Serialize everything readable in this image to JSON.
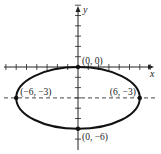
{
  "diagram": {
    "type": "ellipse-graph",
    "axes": {
      "x_label": "x",
      "y_label": "y",
      "x_range": [
        -7,
        7
      ],
      "y_range": [
        -7,
        6
      ],
      "tick_step": 1
    },
    "ellipse": {
      "center": [
        0,
        -3
      ],
      "a": 6,
      "b": 3,
      "color": "#111111"
    },
    "dashed_line": {
      "y": -3
    },
    "points": [
      {
        "x": 0,
        "y": 0,
        "label": "(0, 0)",
        "anchor": "above-right"
      },
      {
        "x": -6,
        "y": -3,
        "label": "(−6, −3)",
        "anchor": "above-right"
      },
      {
        "x": 6,
        "y": -3,
        "label": "(6, −3)",
        "anchor": "above-left"
      },
      {
        "x": 0,
        "y": -6,
        "label": "(0, −6)",
        "anchor": "below-right"
      }
    ]
  }
}
